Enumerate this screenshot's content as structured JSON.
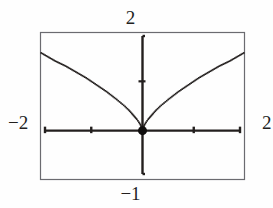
{
  "figure": {
    "kind": "graphing-calculator-plot",
    "background_color": "#fefefe",
    "ink_color": "#231f1e",
    "frame": {
      "left": 40,
      "top": 32,
      "right": 245,
      "bottom": 180,
      "border_color": "#6b6b70",
      "border_width": 1
    }
  },
  "labels": {
    "top": "2",
    "bottom": "−1",
    "left": "−2",
    "right": "2"
  },
  "chart_data": {
    "type": "line",
    "title": "",
    "xlabel": "",
    "ylabel": "",
    "xlim": [
      -2,
      2
    ],
    "ylim": [
      -1,
      2
    ],
    "grid": false,
    "legend": null,
    "x_tick_labels": [
      "−2",
      "2"
    ],
    "y_tick_labels": [
      "−1",
      "2"
    ],
    "x_tick_values": [
      -2,
      -1,
      1,
      2
    ],
    "y_tick_values": [
      1
    ],
    "axes_drawn": [
      "x-axis",
      "y-axis"
    ],
    "series": [
      {
        "name": "curve",
        "style": "dotted-thin",
        "color": "#231f1e",
        "x": [
          -2.0,
          -1.9,
          -1.8,
          -1.7,
          -1.6,
          -1.5,
          -1.4,
          -1.3,
          -1.2,
          -1.1,
          -1.0,
          -0.9,
          -0.8,
          -0.7,
          -0.6,
          -0.5,
          -0.42,
          -0.34,
          -0.27,
          -0.21,
          -0.16,
          -0.11,
          -0.07,
          -0.04,
          -0.02,
          0.0,
          0.02,
          0.04,
          0.07,
          0.11,
          0.16,
          0.21,
          0.27,
          0.34,
          0.42,
          0.5,
          0.6,
          0.7,
          0.8,
          0.9,
          1.0,
          1.1,
          1.2,
          1.3,
          1.4,
          1.5,
          1.6,
          1.7,
          1.8,
          1.9,
          2.0
        ],
        "y": [
          1.59,
          1.53,
          1.47,
          1.41,
          1.36,
          1.31,
          1.25,
          1.19,
          1.13,
          1.07,
          1.0,
          0.93,
          0.86,
          0.79,
          0.71,
          0.63,
          0.56,
          0.49,
          0.42,
          0.35,
          0.29,
          0.23,
          0.17,
          0.12,
          0.07,
          0.0,
          0.07,
          0.12,
          0.17,
          0.23,
          0.29,
          0.35,
          0.42,
          0.49,
          0.56,
          0.63,
          0.71,
          0.79,
          0.86,
          0.93,
          1.0,
          1.07,
          1.13,
          1.19,
          1.25,
          1.31,
          1.36,
          1.41,
          1.47,
          1.53,
          1.59
        ]
      }
    ],
    "markers": [
      {
        "name": "origin-point",
        "x": 0,
        "y": 0,
        "shape": "filled-circle",
        "size": 9,
        "color": "#100e0e"
      }
    ]
  }
}
